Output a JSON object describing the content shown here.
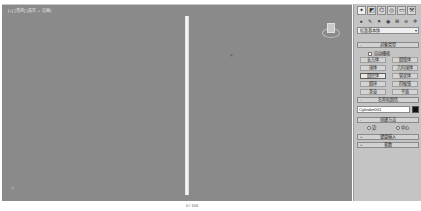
{
  "viewport": {
    "label": "[+] [透视] [真实 + 边面]",
    "object": "cylinder",
    "viewcube": "viewcube"
  },
  "timeline": {
    "text": "0 / 100"
  },
  "command_panel": {
    "tabs": [
      {
        "icon": "create-icon",
        "glyph": "✦",
        "active": true
      },
      {
        "icon": "modify-icon",
        "glyph": "◩",
        "active": false
      },
      {
        "icon": "hierarchy-icon",
        "glyph": "⌬",
        "active": false
      },
      {
        "icon": "motion-icon",
        "glyph": "◎",
        "active": false
      },
      {
        "icon": "display-icon",
        "glyph": "▭",
        "active": false
      },
      {
        "icon": "utilities-icon",
        "glyph": "⚒",
        "active": false
      }
    ],
    "subtabs": [
      {
        "icon": "geometry-icon",
        "glyph": "●"
      },
      {
        "icon": "shapes-icon",
        "glyph": "✎"
      },
      {
        "icon": "lights-icon",
        "glyph": "✷"
      },
      {
        "icon": "cameras-icon",
        "glyph": "◉"
      },
      {
        "icon": "helpers-icon",
        "glyph": "⊞"
      },
      {
        "icon": "spacewarps-icon",
        "glyph": "≋"
      },
      {
        "icon": "systems-icon",
        "glyph": "✲"
      }
    ],
    "category_dropdown": "标准基本体",
    "object_type_rollout": {
      "title": "对象类型",
      "sign": "-",
      "autogrid_label": "自动栅格",
      "buttons": [
        {
          "label": "长方体",
          "selected": false
        },
        {
          "label": "圆锥体",
          "selected": false
        },
        {
          "label": "球体",
          "selected": false
        },
        {
          "label": "几何球体",
          "selected": false
        },
        {
          "label": "圆柱体",
          "selected": true
        },
        {
          "label": "管状体",
          "selected": false
        },
        {
          "label": "圆环",
          "selected": false
        },
        {
          "label": "四棱锥",
          "selected": false
        },
        {
          "label": "茶壶",
          "selected": false
        },
        {
          "label": "平面",
          "selected": false
        }
      ]
    },
    "name_color_rollout": {
      "title": "名称和颜色",
      "sign": "-",
      "name_value": "Cylinder001",
      "color": "#111111"
    },
    "creation_method_rollout": {
      "title": "创建方法",
      "sign": "-",
      "options": [
        {
          "label": "边",
          "selected": false
        },
        {
          "label": "中心",
          "selected": true
        }
      ]
    },
    "keyboard_entry_rollout": {
      "title": "键盘输入",
      "sign": "+"
    },
    "parameters_rollout": {
      "title": "参数",
      "sign": "+"
    }
  }
}
